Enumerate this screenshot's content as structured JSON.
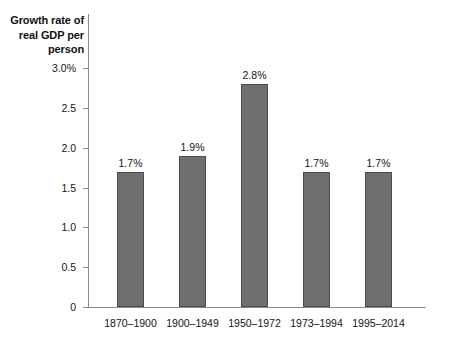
{
  "chart_data": {
    "type": "bar",
    "title": "",
    "ylabel": "Growth rate of\nreal GDP per\nperson",
    "xlabel": "",
    "categories": [
      "1870–1900",
      "1900–1949",
      "1950–1972",
      "1973–1994",
      "1995–2014"
    ],
    "values": [
      1.7,
      1.9,
      2.8,
      1.7,
      1.7
    ],
    "value_labels": [
      "1.7%",
      "1.9%",
      "2.8%",
      "1.7%",
      "1.7%"
    ],
    "ylim": [
      0,
      3.0
    ],
    "ytick_values": [
      3.0,
      2.5,
      2.0,
      1.5,
      1.0,
      0.5,
      0
    ],
    "ytick_labels": [
      "3.0%",
      "2.5",
      "2.0",
      "1.5",
      "1.0",
      "0.5",
      "0"
    ],
    "grid": false,
    "legend": null,
    "colors": {
      "bar_fill": "#6f6f70",
      "bar_stroke": "#4b4b4c",
      "axis": "#8a8a8a",
      "text": "#141414",
      "background": "#ffffff"
    }
  }
}
